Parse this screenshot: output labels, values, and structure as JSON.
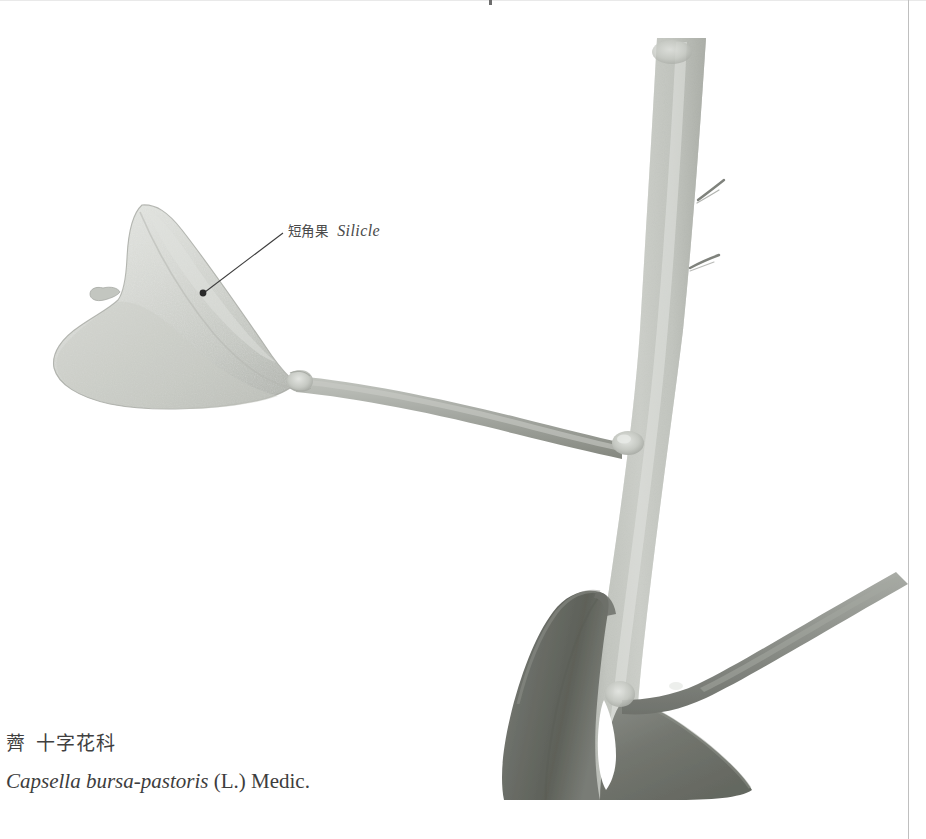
{
  "plate": {
    "background_color": "#ffffff",
    "width": 926,
    "height": 839
  },
  "annotation": {
    "leader_label": {
      "chinese": "短角果",
      "english": "Silicle",
      "text_color": "#4a4a4a",
      "leader_line_color": "#3c3c3c",
      "point_marker": "dot-marker"
    }
  },
  "caption": {
    "common_name_cn": "薺",
    "family_cn": "十字花科",
    "binomial": "Capsella bursa-pastoris",
    "authority": "(L.) Medic.",
    "text_color": "#3a3a3a"
  },
  "specimen": {
    "name": "shepherds-purse-stem-with-silicle",
    "parts": [
      {
        "name": "silicle-fruit",
        "label": "短角果 Silicle",
        "fill": "#d2d4cf",
        "shade": "#b7bab4"
      },
      {
        "name": "silicle-style-beak",
        "fill": "#c5c8c2"
      },
      {
        "name": "pedicel-upper",
        "fill": "#b0b2ac"
      },
      {
        "name": "main-stem",
        "fill": "#c9cbc5",
        "shade": "#a9aca6"
      },
      {
        "name": "stem-trichomes",
        "count": 2,
        "fill": "#8e908b"
      },
      {
        "name": "stem-node-upper",
        "fill": "#bec1bb"
      },
      {
        "name": "pedicel-lower",
        "fill": "#9a9d97"
      },
      {
        "name": "cauline-leaf-left-lobe",
        "fill": "#6e716c"
      },
      {
        "name": "cauline-leaf-right-lobe",
        "fill": "#7a7d78"
      }
    ]
  },
  "colors": {
    "paper": "#ffffff",
    "stem_light": "#cfd1cb",
    "stem_mid": "#aaada7",
    "stem_dark": "#8a8d87",
    "leaf_dark": "#63665f",
    "leaf_mid": "#848780",
    "fruit_pale": "#d9dbd6",
    "rule": "#bfbfbf"
  }
}
